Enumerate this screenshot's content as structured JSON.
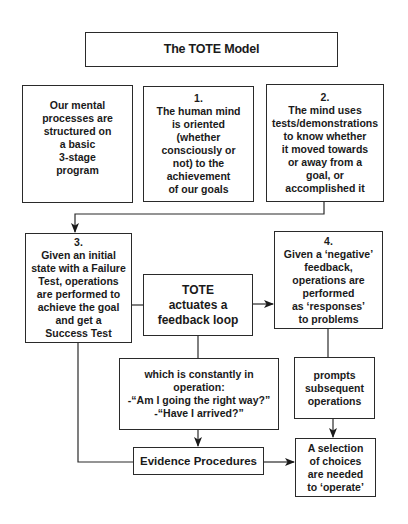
{
  "diagram": {
    "title": "The TOTE Model",
    "colors": {
      "stroke": "#2a2a2a",
      "background": "#ffffff",
      "text": "#1a1a1a"
    },
    "boxes": {
      "intro": {
        "lines": [
          "Our mental",
          "processes are",
          "structured on",
          "a basic",
          "3-stage",
          "program"
        ]
      },
      "step1": {
        "number": "1.",
        "lines": [
          "The human mind",
          "is oriented",
          "(whether",
          "consciously or",
          "not) to the",
          "achievement",
          "of our goals"
        ]
      },
      "step2": {
        "number": "2.",
        "lines": [
          "The mind uses",
          "tests/demonstrations",
          "to know whether",
          "it moved towards",
          "or away from a",
          "goal, or",
          "accomplished it"
        ]
      },
      "step3": {
        "number": "3.",
        "lines": [
          "Given an initial",
          "state with a Failure",
          "Test, operations",
          "are performed to",
          "achieve the goal",
          "and get a",
          "Success Test"
        ]
      },
      "tote": {
        "lines": [
          "TOTE",
          "actuates a",
          "feedback loop"
        ]
      },
      "step4": {
        "number": "4.",
        "lines": [
          "Given a ‘negative’",
          "feedback,",
          "operations are",
          "performed",
          "as ‘responses’",
          "to problems"
        ]
      },
      "constant": {
        "lines": [
          "which is constantly in",
          "operation:",
          "-“Am I going the right way?”",
          "-“Have I arrived?”"
        ]
      },
      "prompts": {
        "lines": [
          "prompts",
          "subsequent",
          "operations"
        ]
      },
      "evidence": {
        "lines": [
          "Evidence Procedures"
        ]
      },
      "selection": {
        "lines": [
          "A selection",
          "of choices",
          "are needed",
          "to ‘operate’"
        ]
      }
    },
    "connectors": [
      {
        "from": "step2",
        "to": "step3",
        "arrow": true
      },
      {
        "from": "step3",
        "to": "tote",
        "arrow": false
      },
      {
        "from": "tote",
        "to": "step4",
        "arrow": true
      },
      {
        "from": "tote",
        "to": "constant",
        "arrow": false
      },
      {
        "from": "constant",
        "to": "evidence",
        "arrow": true
      },
      {
        "from": "step3",
        "to": "evidence",
        "arrow": false
      },
      {
        "from": "step4",
        "to": "prompts",
        "arrow": false
      },
      {
        "from": "prompts",
        "to": "selection",
        "arrow": true
      },
      {
        "from": "evidence",
        "to": "selection",
        "arrow": true
      }
    ]
  }
}
